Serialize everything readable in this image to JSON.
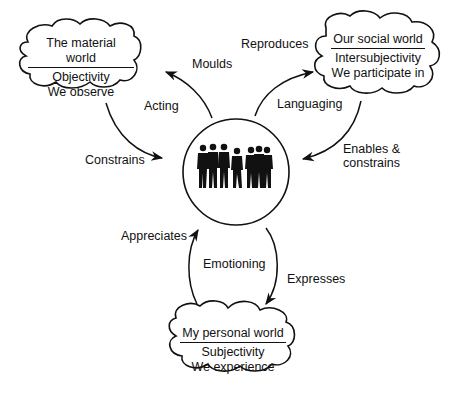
{
  "diagram": {
    "center": {
      "label": "people-group-silhouette"
    },
    "worlds": [
      {
        "id": "material",
        "title": "The material world",
        "line1": "Objectivity",
        "line2": "We observe"
      },
      {
        "id": "social",
        "title": "Our social world",
        "line1": "Intersubjectivity",
        "line2": "We participate in"
      },
      {
        "id": "personal",
        "title": "My personal world",
        "line1": "Subjectivity",
        "line2": "We experience"
      }
    ],
    "edges": {
      "moulds": "Moulds",
      "acting": "Acting",
      "constrains": "Constrains",
      "reproduces": "Reproduces",
      "languaging": "Languaging",
      "enables_constrains_1": "Enables &",
      "enables_constrains_2": "constrains",
      "appreciates": "Appreciates",
      "emotioning": "Emotioning",
      "expresses": "Expresses"
    },
    "colors": {
      "ink": "#111111",
      "background": "#ffffff"
    }
  }
}
